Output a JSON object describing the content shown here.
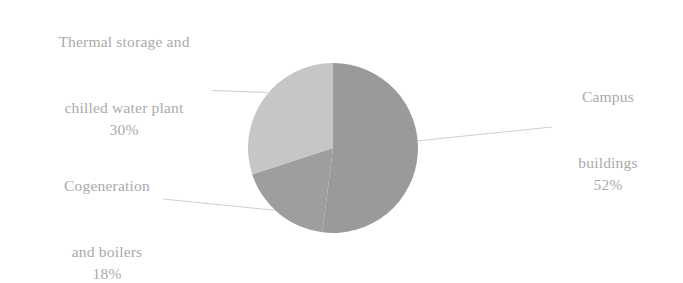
{
  "chart_data": {
    "type": "pie",
    "title": "",
    "categories": [
      "Campus buildings",
      "Thermal storage and chilled water plant",
      "Cogeneration and boilers"
    ],
    "values": [
      52,
      30,
      18
    ],
    "value_labels": [
      "52%",
      "30%",
      "18%"
    ],
    "units": "percent",
    "legend": "none",
    "grid": false,
    "slice_colors": [
      "#9a9a9a",
      "#c6c6c6",
      "#9e9e9e"
    ],
    "start_angle_deg": 0,
    "direction": "clockwise"
  },
  "labels": {
    "campus": {
      "line1": "Campus",
      "line2": "buildings",
      "percent": "52%"
    },
    "thermal": {
      "line1": "Thermal storage and",
      "line2": "chilled water plant",
      "percent": "30%"
    },
    "cogeneration": {
      "line1": "Cogeneration",
      "line2": "and boilers",
      "percent": "18%"
    }
  },
  "colors": {
    "campus_slice": "#9a9a9a",
    "thermal_slice": "#c6c6c6",
    "cogeneration_slice": "#9e9e9e",
    "label_text": "#aaaaaa",
    "leader_line": "#c9c9c9",
    "background": "#ffffff"
  }
}
